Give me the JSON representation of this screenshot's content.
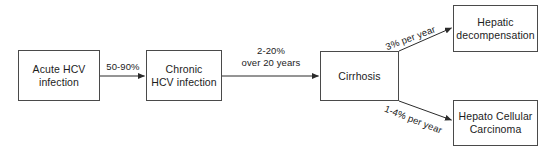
{
  "diagram": {
    "type": "flowchart",
    "background_color": "#ffffff",
    "stroke_color": "#4a4a4a",
    "text_color": "#1c1c1c",
    "nodes": [
      {
        "id": "acute",
        "label": "Acute HCV\ninfection"
      },
      {
        "id": "chronic",
        "label": "Chronic\nHCV infection"
      },
      {
        "id": "cirrhosis",
        "label": "Cirrhosis"
      },
      {
        "id": "decompensation",
        "label": "Hepatic\ndecompensation"
      },
      {
        "id": "hcc",
        "label": "Hepato Cellular\nCarcinoma"
      }
    ],
    "edges": [
      {
        "id": "acute-to-chronic",
        "from": "acute",
        "to": "chronic",
        "label": "50-90%"
      },
      {
        "id": "chronic-to-cirrhosis",
        "from": "chronic",
        "to": "cirrhosis",
        "label": "2-20%\nover 20 years"
      },
      {
        "id": "cirrhosis-to-decompensation",
        "from": "cirrhosis",
        "to": "decompensation",
        "label": "3% per year"
      },
      {
        "id": "cirrhosis-to-hcc",
        "from": "cirrhosis",
        "to": "hcc",
        "label": "1-4% per year"
      }
    ]
  }
}
